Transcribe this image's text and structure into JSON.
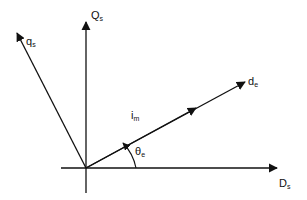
{
  "diagram": {
    "type": "vector-phasor-diagram",
    "stroke_color": "#111111",
    "background": "#ffffff",
    "axes": {
      "horizontal": {
        "name": "D",
        "subscript": "s"
      },
      "vertical": {
        "name": "Q",
        "subscript": "s"
      }
    },
    "vectors": [
      {
        "name": "q",
        "subscript": "s",
        "direction": "upper-left"
      },
      {
        "name": "d",
        "subscript": "e",
        "direction": "upper-right"
      }
    ],
    "current_vector": {
      "name": "i",
      "subscript": "m"
    },
    "angle": {
      "name": "θ",
      "subscript": "e"
    }
  }
}
